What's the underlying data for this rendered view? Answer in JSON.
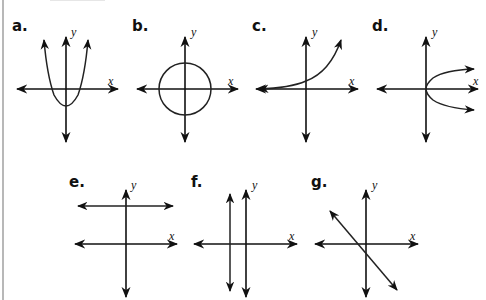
{
  "figure": {
    "axis_labels": {
      "x": "x",
      "y": "y"
    },
    "colors": {
      "ink": "#111111",
      "background": "#ffffff",
      "border": "#b8b8b8"
    },
    "graphs": [
      {
        "label": "a.",
        "type": "parabola-up",
        "description": "Upward-opening parabola with vertex below origin"
      },
      {
        "label": "b.",
        "type": "circle",
        "description": "Circle centered at the origin"
      },
      {
        "label": "c.",
        "type": "exponential",
        "description": "Increasing exponential curve with horizontal asymptote along negative x-axis"
      },
      {
        "label": "d.",
        "type": "parabola-right",
        "description": "Right-opening parabola with vertex at origin"
      },
      {
        "label": "e.",
        "type": "horizontal-line",
        "description": "Horizontal line above the x-axis"
      },
      {
        "label": "f.",
        "type": "vertical-line",
        "description": "Vertical line left of the y-axis"
      },
      {
        "label": "g.",
        "type": "decreasing-line",
        "description": "Line with negative slope crossing below origin"
      }
    ]
  }
}
